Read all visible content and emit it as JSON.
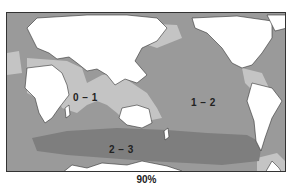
{
  "map": {
    "zones": [
      {
        "label": "0 – 1",
        "shade": "light",
        "color": "#c4c4c4"
      },
      {
        "label": "1 – 2",
        "shade": "medium",
        "color": "#9a9a9a"
      },
      {
        "label": "2 – 3",
        "shade": "dark",
        "color": "#7e7e7e"
      }
    ],
    "land_color": "#ffffff",
    "caption": "90%"
  }
}
